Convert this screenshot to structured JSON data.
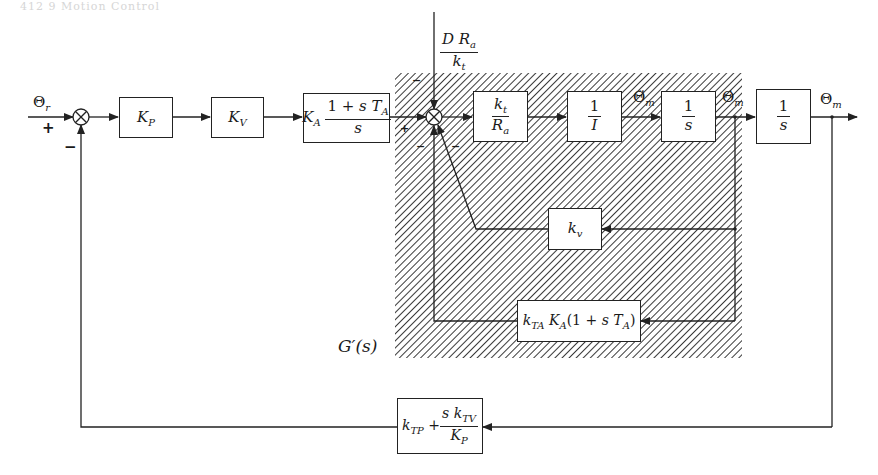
{
  "header": {
    "text": "412    9 Motion Control"
  },
  "signals": {
    "input": "Θ_r",
    "output": "Θ_m",
    "acceleration": "Θ̈_m",
    "velocity": "Θ̇_m",
    "disturbance": {
      "num": "D R_a",
      "den": "k_t"
    }
  },
  "summers": [
    {
      "id": "sum-1",
      "signs": [
        "+",
        "−"
      ]
    },
    {
      "id": "sum-2",
      "signs": [
        "+",
        "−",
        "−",
        "−"
      ]
    }
  ],
  "blocks": {
    "kp": {
      "label": "K",
      "sub": "P"
    },
    "kv": {
      "label": "K",
      "sub": "V"
    },
    "ka": {
      "gain": "K",
      "gain_sub": "A",
      "num": "1 + s T",
      "num_sub": "A",
      "den": "s"
    },
    "kt_ra": {
      "num": "k",
      "num_sub": "t",
      "den": "R",
      "den_sub": "a"
    },
    "inertia": {
      "num": "1",
      "den": "I"
    },
    "integrator1": {
      "num": "1",
      "den": "s"
    },
    "integrator2": {
      "num": "1",
      "den": "s"
    },
    "kv_small": {
      "label": "k",
      "sub": "v"
    },
    "kta": {
      "a": "k",
      "a_sub": "TA",
      "b": "K",
      "b_sub": "A",
      "c": "(1 + s T",
      "c_sub": "A",
      "d": ")"
    },
    "feedback": {
      "a": "k",
      "a_sub": "TP",
      "plus": "+",
      "num": "s k",
      "num_sub": "TV",
      "den": "K",
      "den_sub": "P"
    }
  },
  "subsystem": {
    "label": "G′(s)",
    "hatch_color": "#3a3a3a"
  },
  "colors": {
    "line": "#222222",
    "background": "#ffffff"
  }
}
